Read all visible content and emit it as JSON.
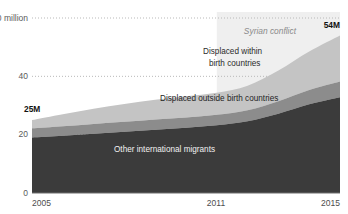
{
  "chart_data": {
    "type": "area",
    "title": "",
    "subtitle": "",
    "xlabel": "",
    "ylabel": "",
    "stacked": true,
    "grid": true,
    "grid_style": "dotted-horizontal",
    "legend_position": "inline-labels",
    "x": [
      2005,
      2006,
      2007,
      2008,
      2009,
      2010,
      2011,
      2012,
      2013,
      2014,
      2015
    ],
    "xlim": [
      2005,
      2015
    ],
    "ylim": [
      0,
      60
    ],
    "yticks": [
      0,
      20,
      40,
      60
    ],
    "ytick_labels": [
      "0",
      "20",
      "40",
      "60 million"
    ],
    "xticks": [
      2005,
      2011,
      2015
    ],
    "xtick_labels": [
      "2005",
      "2011",
      "2015"
    ],
    "y_unit": "million",
    "series": [
      {
        "name": "Other international migrants",
        "color": "#3b3b3b",
        "values": [
          19.0,
          19.6,
          20.3,
          21.0,
          21.7,
          22.4,
          23.2,
          24.6,
          27.2,
          30.4,
          32.8
        ]
      },
      {
        "name": "Displaced outside birth countries",
        "color": "#8c8c8c",
        "values": [
          3.2,
          3.3,
          3.4,
          3.4,
          3.5,
          3.5,
          3.6,
          3.8,
          4.3,
          4.9,
          5.4
        ]
      },
      {
        "name": "Displaced within birth countries",
        "color": "#c4c4c4",
        "values": [
          2.8,
          4.1,
          5.2,
          6.1,
          6.8,
          7.3,
          7.6,
          8.4,
          10.5,
          13.2,
          15.8
        ]
      }
    ],
    "totals": [
      25.0,
      27.0,
      28.9,
      30.5,
      32.0,
      33.2,
      34.4,
      36.8,
      42.0,
      48.5,
      54.0
    ],
    "annotations": [
      {
        "name": "start-total",
        "text": "25M",
        "x": 2005,
        "y": 25.0
      },
      {
        "name": "end-total",
        "text": "54M",
        "x": 2015,
        "y": 54.0
      },
      {
        "name": "highlight-caption",
        "text": "Syrian conflict",
        "x_start": 2011,
        "x_end": 2015,
        "y_top": 60
      }
    ],
    "highlight_band": {
      "label": "Syrian conflict",
      "x_start": 2011,
      "x_end": 2015,
      "color": "#efefef"
    }
  },
  "axes": {
    "y": {
      "ticks": [
        {
          "label": "60 million",
          "value": 60
        },
        {
          "label": "40",
          "value": 40
        },
        {
          "label": "20",
          "value": 20
        },
        {
          "label": "0",
          "value": 0
        }
      ]
    },
    "x": {
      "ticks": [
        {
          "label": "2005",
          "value": 2005
        },
        {
          "label": "2011",
          "value": 2011
        },
        {
          "label": "2015",
          "value": 2015
        }
      ]
    }
  },
  "band_labels": {
    "top": {
      "line1": "Displaced within",
      "line2": "birth countries"
    },
    "middle": "Displaced outside birth countries",
    "bottom": "Other international migrants"
  },
  "value_labels": {
    "start": "25M",
    "end": "54M"
  },
  "highlight": {
    "caption": "Syrian conflict"
  },
  "colors": {
    "band_top": "#c4c4c4",
    "band_middle": "#8c8c8c",
    "band_bottom": "#3b3b3b",
    "highlight": "#efefef",
    "grid": "#b9b9b9",
    "axis": "#6e6e6e",
    "background": "#ffffff"
  }
}
